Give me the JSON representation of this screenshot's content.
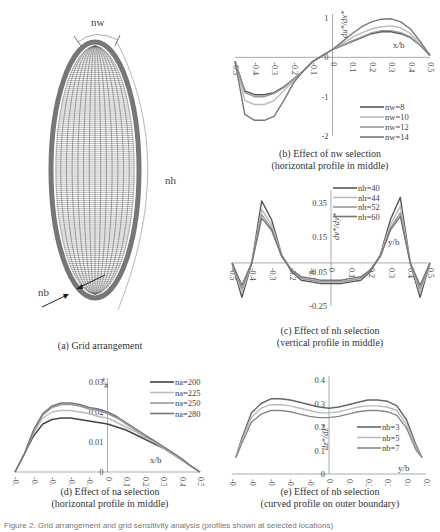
{
  "figure_caption": "Figure 2. Grid arrangement and grid sensitivity analysis (profiles shown at selected locations)",
  "panels": {
    "a": {
      "caption": "(a) Grid arrangement",
      "labels": {
        "nw": "nw",
        "nh": "nh",
        "nb": "nb"
      }
    },
    "b": {
      "caption_line1": "(b) Effect of nw selection",
      "caption_line2": "(horizontal profile in middle)"
    },
    "c": {
      "caption_line1": "(c) Effect of nh selection",
      "caption_line2": "(vertical profile in middle)"
    },
    "d": {
      "caption_line1": "(d) Effect of na selection",
      "caption_line2": "(horizontal profile in middle)"
    },
    "e": {
      "caption_line1": "(e) Effect of nb selection",
      "caption_line2": "(curved profile on outer boundary)"
    }
  },
  "chart_data": [
    {
      "id": "b",
      "type": "line",
      "title": "(b) Effect of nw selection (horizontal profile in middle)",
      "xlabel": "x/b",
      "ylabel": "du*/dx*",
      "xlim": [
        -0.5,
        0.5
      ],
      "ylim": [
        -2,
        1
      ],
      "xticks": [
        "-0.5",
        "-0.4",
        "-0.3",
        "-0.2",
        "-0.1",
        "0",
        "0.1",
        "0.2",
        "0.3",
        "0.4",
        "0.5"
      ],
      "yticks": [
        "1",
        "0",
        "-1",
        "-2"
      ],
      "legend_position": "lower right",
      "x": [
        -0.5,
        -0.45,
        -0.4,
        -0.35,
        -0.3,
        -0.25,
        -0.2,
        -0.15,
        -0.1,
        -0.05,
        0,
        0.05,
        0.1,
        0.15,
        0.2,
        0.25,
        0.3,
        0.35,
        0.4,
        0.45,
        0.5
      ],
      "series": [
        {
          "name": "nw=8",
          "color": "#555555",
          "values": [
            -0.1,
            -0.85,
            -0.95,
            -0.95,
            -0.9,
            -0.75,
            -0.55,
            -0.35,
            -0.1,
            0.05,
            0.2,
            0.3,
            0.4,
            0.5,
            0.6,
            0.65,
            0.65,
            0.6,
            0.5,
            0.3,
            0.05
          ]
        },
        {
          "name": "nw=10",
          "color": "#bbbbbb",
          "values": [
            -0.1,
            -1.1,
            -1.2,
            -1.2,
            -1.1,
            -0.85,
            -0.6,
            -0.35,
            -0.1,
            0.05,
            0.2,
            0.35,
            0.5,
            0.62,
            0.72,
            0.78,
            0.8,
            0.75,
            0.6,
            0.35,
            0.05
          ]
        },
        {
          "name": "nw=12",
          "color": "#999999",
          "values": [
            -0.1,
            -0.9,
            -1.0,
            -1.0,
            -0.92,
            -0.77,
            -0.56,
            -0.35,
            -0.1,
            0.05,
            0.2,
            0.3,
            0.42,
            0.52,
            0.62,
            0.68,
            0.68,
            0.63,
            0.52,
            0.3,
            0.05
          ]
        },
        {
          "name": "nw=14",
          "color": "#777777",
          "values": [
            -0.1,
            -1.45,
            -1.6,
            -1.6,
            -1.5,
            -1.1,
            -0.65,
            -0.35,
            -0.1,
            0.05,
            0.2,
            0.4,
            0.6,
            0.78,
            0.9,
            0.97,
            0.98,
            0.9,
            0.72,
            0.4,
            0.05
          ]
        }
      ]
    },
    {
      "id": "c",
      "type": "line",
      "title": "(c) Effect of nh selection (vertical profile in middle)",
      "xlabel": "y/b",
      "ylabel": "dv*/dy*",
      "xlim": [
        -0.5,
        0.5
      ],
      "ylim": [
        -0.25,
        0.4
      ],
      "xticks": [
        "-0.5",
        "-0.4",
        "-0.3",
        "-0.2",
        "-0.1",
        "0",
        "0.1",
        "0.2",
        "0.3",
        "0.4",
        "0.5"
      ],
      "yticks": [
        "0.35",
        "0.15",
        "-0.05",
        "-0.25"
      ],
      "legend_position": "upper right",
      "x": [
        -0.5,
        -0.45,
        -0.4,
        -0.35,
        -0.3,
        -0.25,
        -0.2,
        -0.15,
        -0.1,
        -0.05,
        0,
        0.05,
        0.1,
        0.15,
        0.2,
        0.25,
        0.3,
        0.35,
        0.4,
        0.45,
        0.5
      ],
      "series": [
        {
          "name": "nh=40",
          "color": "#555555",
          "values": [
            0.0,
            -0.2,
            0.0,
            0.36,
            0.25,
            0.05,
            -0.05,
            -0.1,
            -0.11,
            -0.12,
            -0.12,
            -0.12,
            -0.11,
            -0.1,
            -0.05,
            0.05,
            0.25,
            0.38,
            0.0,
            -0.2,
            0.0
          ]
        },
        {
          "name": "nh=44",
          "color": "#bbbbbb",
          "values": [
            0.0,
            -0.17,
            0.0,
            0.31,
            0.22,
            0.05,
            -0.04,
            -0.09,
            -0.1,
            -0.11,
            -0.11,
            -0.11,
            -0.1,
            -0.09,
            -0.04,
            0.05,
            0.22,
            0.33,
            0.0,
            -0.17,
            0.0
          ]
        },
        {
          "name": "nh=52",
          "color": "#999999",
          "values": [
            0.0,
            -0.15,
            0.0,
            0.28,
            0.2,
            0.04,
            -0.04,
            -0.09,
            -0.1,
            -0.11,
            -0.11,
            -0.11,
            -0.1,
            -0.09,
            -0.04,
            0.04,
            0.2,
            0.29,
            0.0,
            -0.15,
            0.0
          ]
        },
        {
          "name": "nh=60",
          "color": "#777777",
          "values": [
            0.0,
            -0.13,
            0.0,
            0.26,
            0.19,
            0.04,
            -0.04,
            -0.08,
            -0.09,
            -0.1,
            -0.1,
            -0.1,
            -0.09,
            -0.08,
            -0.04,
            0.04,
            0.19,
            0.27,
            0.0,
            -0.13,
            0.0
          ]
        }
      ]
    },
    {
      "id": "d",
      "type": "line",
      "title": "(d) Effect of na selection (horizontal profile in middle)",
      "xlabel": "x/b",
      "ylabel": "w*",
      "xlim": [
        -0.5,
        0.5
      ],
      "ylim": [
        0,
        0.03
      ],
      "xticks": [
        "-0.5",
        "-0.4",
        "-0.3",
        "-0.2",
        "-0.1",
        "0",
        "0.1",
        "0.2",
        "0.3",
        "0.4",
        "0.5"
      ],
      "yticks": [
        "0.03",
        "0.02",
        "0.01",
        "0"
      ],
      "legend_position": "upper right",
      "x": [
        -0.5,
        -0.45,
        -0.4,
        -0.35,
        -0.3,
        -0.25,
        -0.2,
        -0.15,
        -0.1,
        -0.05,
        0,
        0.05,
        0.1,
        0.15,
        0.2,
        0.25,
        0.3,
        0.35,
        0.4,
        0.45,
        0.5
      ],
      "series": [
        {
          "name": "na=200",
          "color": "#444444",
          "values": [
            0.0,
            0.006,
            0.012,
            0.016,
            0.0175,
            0.018,
            0.018,
            0.0175,
            0.017,
            0.0165,
            0.016,
            0.015,
            0.014,
            0.0125,
            0.011,
            0.0095,
            0.008,
            0.006,
            0.004,
            0.002,
            0.0
          ]
        },
        {
          "name": "na=225",
          "color": "#bbbbbb",
          "values": [
            0.0,
            0.006,
            0.013,
            0.018,
            0.02,
            0.0205,
            0.0205,
            0.02,
            0.0195,
            0.0185,
            0.018,
            0.0165,
            0.015,
            0.0135,
            0.0115,
            0.01,
            0.008,
            0.006,
            0.004,
            0.002,
            0.0
          ]
        },
        {
          "name": "na=250",
          "color": "#999999",
          "values": [
            0.0,
            0.006,
            0.0135,
            0.019,
            0.0215,
            0.0225,
            0.0225,
            0.022,
            0.021,
            0.0205,
            0.0195,
            0.018,
            0.016,
            0.014,
            0.012,
            0.0105,
            0.0085,
            0.0065,
            0.0045,
            0.002,
            0.0
          ]
        },
        {
          "name": "na=280",
          "color": "#777777",
          "values": [
            0.0,
            0.006,
            0.014,
            0.0195,
            0.022,
            0.023,
            0.023,
            0.0225,
            0.0215,
            0.021,
            0.02,
            0.0185,
            0.0165,
            0.0145,
            0.0125,
            0.0105,
            0.0085,
            0.0065,
            0.0045,
            0.002,
            0.0
          ]
        }
      ]
    },
    {
      "id": "e",
      "type": "line",
      "title": "(e) Effect of nb selection (curved profile on outer boundary)",
      "xlabel": "y/b",
      "ylabel": "dz*/dz*",
      "xlim": [
        -0.5,
        0.5
      ],
      "ylim": [
        0,
        0.4
      ],
      "xticks": [
        "-0.5",
        "-0.4",
        "-0.3",
        "-0.2",
        "-0.1",
        "0",
        "0.1",
        "0.2",
        "0.3",
        "0.4",
        "0.5"
      ],
      "yticks": [
        "0.4",
        "0.3",
        "0.2",
        "0.1",
        "0"
      ],
      "legend_position": "lower right",
      "x": [
        -0.48,
        -0.45,
        -0.4,
        -0.35,
        -0.3,
        -0.25,
        -0.2,
        -0.15,
        -0.1,
        -0.05,
        0,
        0.05,
        0.1,
        0.15,
        0.2,
        0.25,
        0.3,
        0.35,
        0.4,
        0.45,
        0.48
      ],
      "series": [
        {
          "name": "nb=3",
          "color": "#666666",
          "values": [
            0.07,
            0.15,
            0.26,
            0.3,
            0.32,
            0.32,
            0.315,
            0.305,
            0.295,
            0.285,
            0.28,
            0.285,
            0.295,
            0.305,
            0.315,
            0.315,
            0.31,
            0.29,
            0.23,
            0.12,
            0.07
          ]
        },
        {
          "name": "nb=5",
          "color": "#bbbbbb",
          "values": [
            0.07,
            0.14,
            0.24,
            0.28,
            0.295,
            0.295,
            0.29,
            0.28,
            0.27,
            0.26,
            0.26,
            0.265,
            0.275,
            0.285,
            0.29,
            0.29,
            0.285,
            0.27,
            0.21,
            0.11,
            0.07
          ]
        },
        {
          "name": "nb=7",
          "color": "#888888",
          "values": [
            0.07,
            0.13,
            0.22,
            0.255,
            0.27,
            0.27,
            0.265,
            0.255,
            0.245,
            0.24,
            0.24,
            0.245,
            0.255,
            0.265,
            0.27,
            0.27,
            0.265,
            0.25,
            0.195,
            0.1,
            0.07
          ]
        }
      ]
    }
  ]
}
